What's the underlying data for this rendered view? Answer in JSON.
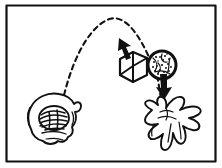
{
  "figure": {
    "title": "Throwing and catching illustration",
    "background_color": "#fdfdfd",
    "paper_color": "#ffffff",
    "ink_color": "#111111",
    "frame": {
      "label": "panel-border",
      "stroke_color": "#111111",
      "stroke_width": 2,
      "x": 6,
      "y": 5,
      "width": 210,
      "height": 157
    },
    "elements": {
      "throwing_hand": {
        "label": "Throwing hand gripping crumpled ball",
        "position_x": 52,
        "position_y": 115
      },
      "crumpled_ball": {
        "label": "Crumpled hatched ball in fist",
        "texture": "hatched"
      },
      "trajectory": {
        "label": "Dashed parabolic trajectory",
        "style": "dashed",
        "dash_pattern": "5 4",
        "stroke_width": 2,
        "start_x": 62,
        "start_y": 103,
        "apex_x": 107,
        "apex_y": 19,
        "end_x": 160,
        "end_y": 104
      },
      "cube": {
        "label": "White cube in isometric view",
        "center_x": 133,
        "center_y": 67,
        "faces": 3
      },
      "sphere": {
        "label": "Stippled textured sphere",
        "center_x": 162,
        "center_y": 65,
        "radius": 14,
        "texture": "stippled"
      },
      "arrow_up": {
        "label": "Arrow pointing up-left toward apex",
        "direction": "up-left",
        "tip_x": 119,
        "tip_y": 38
      },
      "arrow_down": {
        "label": "Arrow pointing down toward catching hand",
        "direction": "down",
        "tip_x": 164,
        "tip_y": 98
      },
      "catching_hand": {
        "label": "Open hand with spread fingers catching",
        "position_x": 172,
        "position_y": 120
      }
    }
  }
}
